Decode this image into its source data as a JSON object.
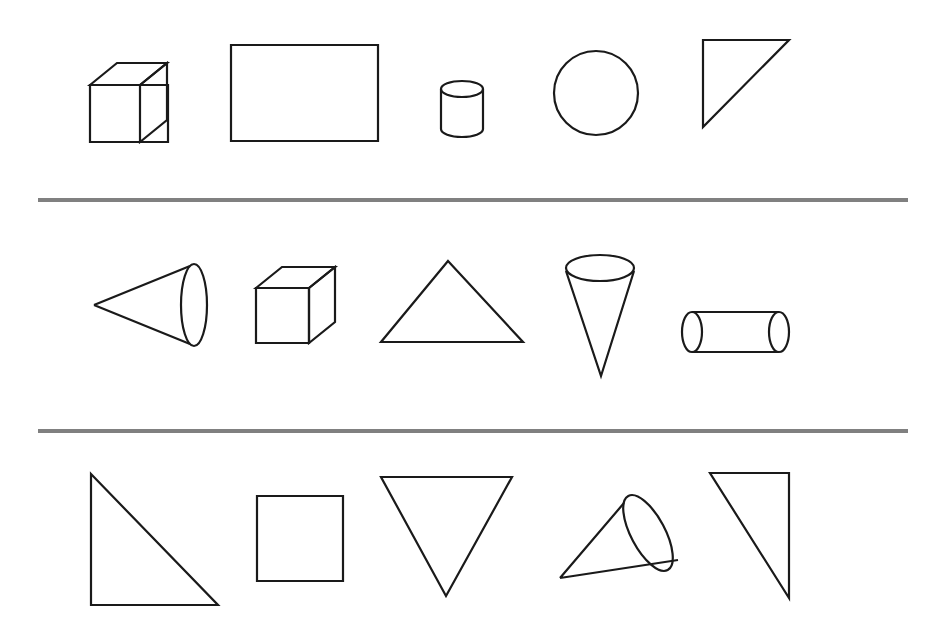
{
  "canvas": {
    "width": 947,
    "height": 638,
    "background": "#ffffff",
    "stroke_color": "#1a1a1a",
    "divider_color": "#808080",
    "stroke_width": 2.2,
    "divider_width": 4
  },
  "dividers": [
    {
      "name": "divider-row1-row2",
      "x1": 38,
      "y1": 200,
      "x2": 908,
      "y2": 200
    },
    {
      "name": "divider-row2-row3",
      "x1": 38,
      "y1": 431,
      "x2": 908,
      "y2": 431
    }
  ],
  "rows": [
    {
      "id": "row-1",
      "index": 1,
      "shapes": [
        {
          "id": "r1-s1",
          "name": "cube",
          "kind": "cube",
          "label": "Cube",
          "front": [
            90,
            85,
            78,
            57
          ],
          "top_path": "M 90 85 L 117 63 L 167 63 L 140 85 Z",
          "side_path": "M 140 85 L 167 63 L 167 120 L 140 142 Z"
        },
        {
          "id": "r1-s2",
          "name": "rectangle",
          "kind": "rectangle",
          "label": "Rectangle",
          "rect": [
            231,
            45,
            147,
            96
          ]
        },
        {
          "id": "r1-s3",
          "name": "cylinder-vertical",
          "kind": "cylinder-vertical",
          "label": "Cylinder",
          "cx": 462,
          "top_cy": 89,
          "bottom_cy": 129,
          "rx": 21,
          "ry": 8,
          "left_x": 441,
          "right_x": 483
        },
        {
          "id": "r1-s4",
          "name": "circle",
          "kind": "circle",
          "label": "Circle",
          "cx": 596,
          "cy": 93,
          "r": 42
        },
        {
          "id": "r1-s5",
          "name": "right-triangle-top-left",
          "kind": "triangle",
          "label": "Right triangle",
          "points": "703,40 789,40 703,127"
        }
      ]
    },
    {
      "id": "row-2",
      "index": 2,
      "shapes": [
        {
          "id": "r2-s1",
          "name": "cone-pointing-left",
          "kind": "cone",
          "label": "Cone",
          "apex": [
            94,
            305
          ],
          "ecx": 194,
          "ecy": 305,
          "erx": 13,
          "ery": 41
        },
        {
          "id": "r2-s2",
          "name": "cube",
          "kind": "cube",
          "label": "Cube",
          "front": [
            256,
            288,
            79,
            55
          ],
          "top_path": "M 256 288 L 282 267 L 335 267 L 309 288 Z",
          "side_path": "M 309 288 L 335 267 L 335 322 L 309 343 Z"
        },
        {
          "id": "r2-s3",
          "name": "triangle-upward",
          "kind": "triangle",
          "label": "Triangle",
          "points": "448,261 523,342 381,342"
        },
        {
          "id": "r2-s4",
          "name": "cone-pointing-down",
          "kind": "cone",
          "label": "Cone",
          "apex": [
            601,
            376
          ],
          "ecx": 600,
          "ecy": 268,
          "erx": 34,
          "ery": 13
        },
        {
          "id": "r2-s5",
          "name": "cylinder-horizontal",
          "kind": "cylinder-horizontal",
          "label": "Cylinder",
          "cy": 332,
          "left_cx": 692,
          "right_cx": 779,
          "rx": 10,
          "ry": 20,
          "top_y": 312,
          "bottom_y": 352
        }
      ]
    },
    {
      "id": "row-3",
      "index": 3,
      "shapes": [
        {
          "id": "r3-s1",
          "name": "right-triangle-bottom-left",
          "kind": "triangle",
          "label": "Right triangle",
          "points": "91,474 218,605 91,605"
        },
        {
          "id": "r3-s2",
          "name": "square",
          "kind": "square",
          "label": "Square",
          "rect": [
            257,
            496,
            86,
            85
          ]
        },
        {
          "id": "r3-s3",
          "name": "triangle-inverted",
          "kind": "triangle",
          "label": "Inverted triangle",
          "points": "381,477 512,477 446,596"
        },
        {
          "id": "r3-s4",
          "name": "cone-tilted",
          "kind": "cone",
          "label": "Cone",
          "apex": [
            560,
            578
          ],
          "ecx": 645,
          "ecy": 535,
          "erx": 15,
          "ery": 42,
          "rotation": -25
        },
        {
          "id": "r3-s5",
          "name": "right-triangle-right-edge",
          "kind": "triangle",
          "label": "Right triangle",
          "points": "710,473 789,473 789,598"
        }
      ]
    }
  ]
}
